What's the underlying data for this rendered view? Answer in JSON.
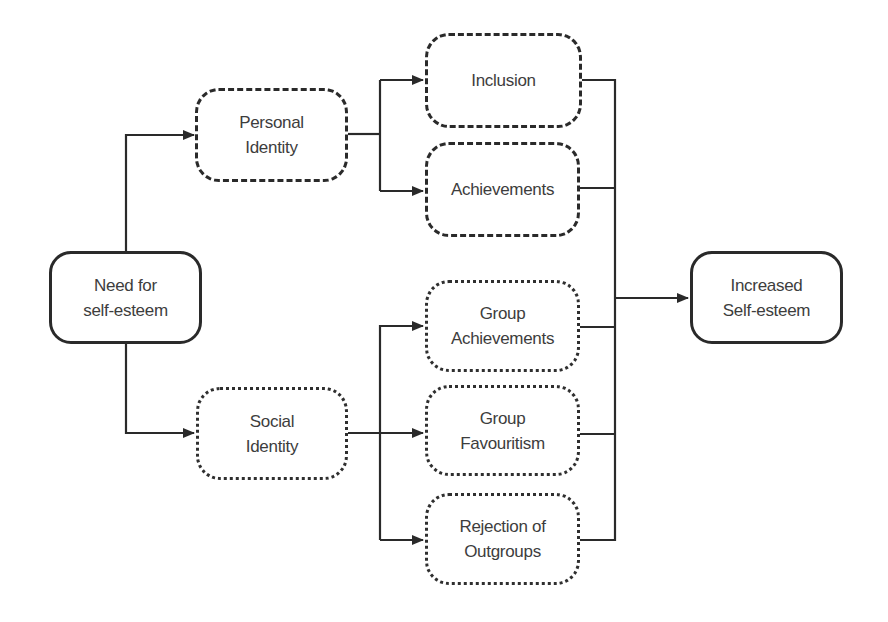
{
  "diagram": {
    "title": "",
    "nodes": {
      "need": {
        "label": "Need for\nself-esteem",
        "style": "solid"
      },
      "personal_identity": {
        "label": "Personal\nIdentity",
        "style": "dashed"
      },
      "social_identity": {
        "label": "Social\nIdentity",
        "style": "dotted"
      },
      "inclusion": {
        "label": "Inclusion",
        "style": "dashed"
      },
      "achievements": {
        "label": "Achievements",
        "style": "dashed"
      },
      "group_achievements": {
        "label": "Group\nAchievements",
        "style": "dotted"
      },
      "group_favouritism": {
        "label": "Group\nFavouritism",
        "style": "dotted"
      },
      "rejection_outgroups": {
        "label": "Rejection of\nOutgroups",
        "style": "dotted"
      },
      "increased": {
        "label": "Increased\nSelf-esteem",
        "style": "solid"
      }
    },
    "edges": [
      {
        "from": "need",
        "to": "personal_identity"
      },
      {
        "from": "need",
        "to": "social_identity"
      },
      {
        "from": "personal_identity",
        "to": "inclusion"
      },
      {
        "from": "personal_identity",
        "to": "achievements"
      },
      {
        "from": "social_identity",
        "to": "group_achievements"
      },
      {
        "from": "social_identity",
        "to": "group_favouritism"
      },
      {
        "from": "social_identity",
        "to": "rejection_outgroups"
      },
      {
        "from": "inclusion",
        "to": "increased"
      },
      {
        "from": "achievements",
        "to": "increased"
      },
      {
        "from": "group_achievements",
        "to": "increased"
      },
      {
        "from": "group_favouritism",
        "to": "increased"
      },
      {
        "from": "rejection_outgroups",
        "to": "increased"
      }
    ],
    "colors": {
      "line": "#2a2a2a",
      "text": "#3d3d3d",
      "background": "#ffffff"
    }
  }
}
